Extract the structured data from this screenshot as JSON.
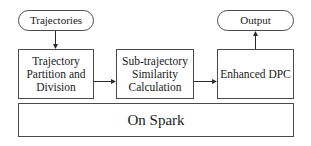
{
  "diagram": {
    "nodes": {
      "trajectories": {
        "label": "Trajectories",
        "shape": "rounded-terminal"
      },
      "output": {
        "label": "Output",
        "shape": "rounded-terminal"
      },
      "partition": {
        "label_lines": [
          "Trajectory",
          "Partition and",
          "Division"
        ],
        "shape": "rectangle"
      },
      "similarity": {
        "label_lines": [
          "Sub-trajectory",
          "Similarity",
          "Calculation"
        ],
        "shape": "rectangle"
      },
      "dpc": {
        "label": "Enhanced DPC",
        "shape": "rectangle"
      },
      "spark": {
        "label": "On Spark",
        "shape": "rectangle"
      }
    },
    "edges": [
      {
        "from": "trajectories",
        "to": "partition"
      },
      {
        "from": "partition",
        "to": "similarity"
      },
      {
        "from": "similarity",
        "to": "dpc"
      },
      {
        "from": "dpc",
        "to": "output"
      }
    ],
    "colors": {
      "stroke": "#4a4a4a",
      "text": "#1a1a1a",
      "background": "#ffffff"
    }
  }
}
